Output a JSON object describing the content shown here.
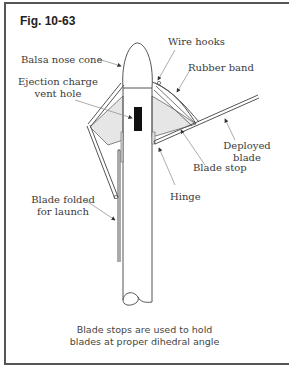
{
  "figure": {
    "title": "Fig. 10-63",
    "labels": {
      "nose_cone": "Balsa nose cone",
      "wire_hooks": "Wire hooks",
      "rubber_band": "Rubber band",
      "vent_hole_line1": "Ejection charge",
      "vent_hole_line2": "vent hole",
      "deployed_line1": "Deployed",
      "deployed_line2": "blade",
      "blade_stop": "Blade stop",
      "hinge": "Hinge",
      "folded_line1": "Blade folded",
      "folded_line2": "for launch"
    },
    "caption_line1": "Blade stops are used to hold",
    "caption_line2": "blades at proper dihedral angle"
  },
  "colors": {
    "line": "#555555",
    "fill_shade": "#e6e6e6",
    "vent": "#111111",
    "leader": "#888888"
  }
}
